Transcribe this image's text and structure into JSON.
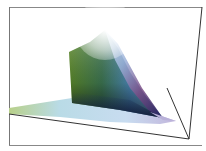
{
  "figure": {
    "type": "3d-color-gamut-plot",
    "frame_color": "#555555",
    "background": "#ffffff"
  },
  "gamut_colors": {
    "green_wall": "#5a8a2a",
    "green_dark": "#1f3d1a",
    "cyan_mid": "#7fbfe0",
    "blue_dark": "#1a2060",
    "magenta_edge": "#8a4a7a",
    "peak_white": "#ffffff",
    "base_light": "#c9dcef",
    "base_green": "#b6cf8a",
    "tip_lavender": "#b8b0d8"
  }
}
